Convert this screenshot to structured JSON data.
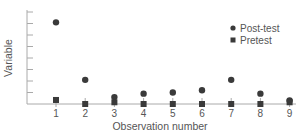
{
  "chart_data": {
    "type": "scatter",
    "title": "",
    "xlabel": "Observation number",
    "ylabel": "Variable",
    "categories": [
      "1",
      "2",
      "3",
      "4",
      "5",
      "6",
      "7",
      "8",
      "9"
    ],
    "x": [
      1,
      2,
      3,
      4,
      5,
      6,
      7,
      8,
      9
    ],
    "ylim": [
      0,
      8
    ],
    "y_ticks": 8,
    "y_tick_labels": [],
    "grid": false,
    "legend_position": "upper right",
    "series": [
      {
        "name": "Post-test",
        "marker": "circle",
        "values": [
          7.1,
          2.1,
          0.6,
          0.9,
          1.0,
          1.2,
          2.1,
          0.9,
          0.3
        ]
      },
      {
        "name": "Pretest",
        "marker": "square",
        "values": [
          0.35,
          0.0,
          0.15,
          0.0,
          0.0,
          0.0,
          0.0,
          0.0,
          0.15
        ]
      }
    ],
    "colors": {
      "markers": "#3a3a3a",
      "axis": "#aaaaaa",
      "text": "#555555"
    }
  },
  "legend": {
    "items": [
      {
        "label": "Post-test",
        "marker": "circle"
      },
      {
        "label": "Pretest",
        "marker": "square"
      }
    ]
  }
}
